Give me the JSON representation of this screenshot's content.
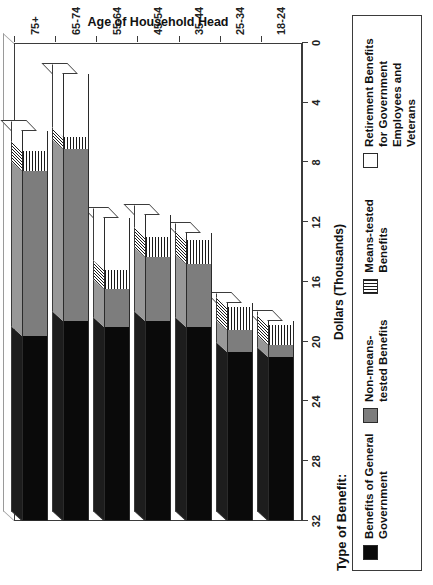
{
  "chart_data": {
    "type": "bar",
    "subtype": "stacked-horizontal-3d",
    "title": "",
    "xlabel": "Age of Household Head",
    "ylabel": "Dollars (Thousands)",
    "categories": [
      "18-24",
      "25-34",
      "35-44",
      "45-54",
      "55-64",
      "65-74",
      "75+"
    ],
    "ylim": [
      0,
      32
    ],
    "yticks": [
      0,
      4,
      8,
      12,
      16,
      20,
      24,
      28,
      32
    ],
    "grid": false,
    "legend_position": "bottom",
    "legend_title": "Type of Benefit:",
    "series": [
      {
        "name": "Benefits of General Government",
        "color": "#0a0a0a",
        "pattern": "solid",
        "values": [
          11.0,
          11.3,
          13.0,
          13.4,
          13.0,
          13.4,
          12.4
        ]
      },
      {
        "name": "Non-means-tested Benefits",
        "color": "#7d7d7d",
        "pattern": "solid",
        "values": [
          0.8,
          1.5,
          4.2,
          4.3,
          2.5,
          11.5,
          11.0
        ]
      },
      {
        "name": "Means-tested Benefits",
        "color": "#ffffff",
        "pattern": "horizontal-hatch",
        "values": [
          1.3,
          1.5,
          1.6,
          1.3,
          1.3,
          0.8,
          1.4
        ]
      },
      {
        "name": "Retirement Benefits for Government Employees and Veterans",
        "color": "#ffffff",
        "pattern": "solid",
        "values": [
          0.3,
          0.3,
          0.5,
          1.5,
          3.5,
          4.2,
          1.3
        ]
      }
    ],
    "totals": [
      13.4,
      14.6,
      19.3,
      20.5,
      20.3,
      29.9,
      26.1
    ]
  },
  "axes": {
    "value_axis": {
      "title": "Dollars (Thousands)",
      "tick_labels": [
        "32",
        "28",
        "24",
        "20",
        "16",
        "12",
        "8",
        "4",
        "0"
      ]
    },
    "category_axis": {
      "title": "Age of Household Head",
      "tick_labels": [
        "18-24",
        "25-34",
        "35-44",
        "45-54",
        "55-64",
        "65-74",
        "75+"
      ]
    }
  },
  "legend": {
    "title": "Type of Benefit:",
    "items": [
      {
        "label": "Benefits of General Government",
        "swatch": "black-swatch"
      },
      {
        "label": "Non-means-tested Benefits",
        "swatch": "gray-swatch"
      },
      {
        "label": "Means-tested Benefits",
        "swatch": "hatched-swatch"
      },
      {
        "label": "Retirement Benefits for Government Employees and Veterans",
        "swatch": "white-swatch"
      }
    ]
  }
}
